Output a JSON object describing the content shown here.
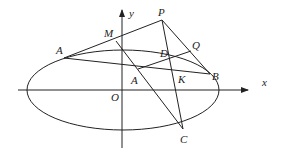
{
  "diagram": {
    "type": "geometry-ellipse-with-lines",
    "colors": {
      "ink": "#222222",
      "background": "#ffffff"
    },
    "axes": {
      "x_label": "x",
      "y_label": "y",
      "origin_label": "O"
    },
    "ellipse": {
      "cx": 123,
      "cy": 90,
      "rx": 96,
      "ry": 40
    },
    "points": {
      "P": {
        "label": "P",
        "x": 162,
        "y": 20
      },
      "M": {
        "label": "M",
        "x": 116,
        "y": 41
      },
      "A_upper": {
        "label": "A",
        "x": 64,
        "y": 58
      },
      "A_lower": {
        "label": "A",
        "x": 138,
        "y": 69
      },
      "D": {
        "label": "D",
        "x": 170,
        "y": 62
      },
      "Q": {
        "label": "Q",
        "x": 191,
        "y": 51
      },
      "K": {
        "label": "K",
        "x": 175,
        "y": 79
      },
      "B": {
        "label": "B",
        "x": 210,
        "y": 74
      },
      "C": {
        "label": "C",
        "x": 183,
        "y": 129
      }
    },
    "segments": [
      [
        "A_upper",
        "P"
      ],
      [
        "A_upper",
        "B"
      ],
      [
        "P",
        "B"
      ],
      [
        "P",
        "C"
      ],
      [
        "M",
        "C"
      ],
      [
        "A_lower",
        "Q"
      ]
    ]
  }
}
